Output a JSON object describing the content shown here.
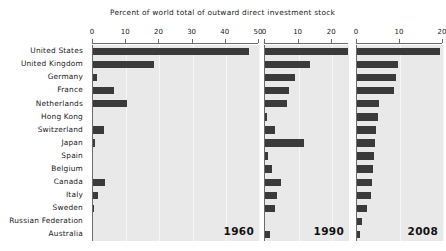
{
  "chart_data": {
    "type": "bar",
    "title": "Percent of world total of outward direct investment stock",
    "xlabel": "",
    "ylabel": "",
    "orientation": "horizontal",
    "grid": true,
    "legend_position": "none",
    "categories": [
      "United States",
      "United Kingdom",
      "Germany",
      "France",
      "Netherlands",
      "Hong Kong",
      "Switzerland",
      "Japan",
      "Spain",
      "Belgium",
      "Canada",
      "Italy",
      "Sweden",
      "Russian Federation",
      "Australia"
    ],
    "panels": [
      {
        "name": "1960",
        "xlim": [
          0,
          50
        ],
        "ticks": [
          0,
          10,
          20,
          30,
          40,
          50
        ],
        "tick_labels": [
          "0",
          "10",
          "20",
          "30",
          "40",
          "50"
        ],
        "values": [
          47.1,
          18.3,
          1.2,
          6.2,
          10.3,
          0.0,
          3.4,
          0.7,
          0.0,
          0.0,
          3.7,
          1.6,
          0.4,
          0.0,
          0.0
        ]
      },
      {
        "name": "1990",
        "xlim": [
          0,
          25
        ],
        "ticks": [
          0,
          10,
          20
        ],
        "tick_labels": [
          "0",
          "10",
          "20"
        ],
        "values": [
          24.6,
          13.3,
          8.8,
          7.0,
          6.4,
          0.7,
          3.1,
          11.6,
          0.9,
          2.0,
          4.9,
          3.5,
          2.9,
          0.0,
          1.5
        ]
      },
      {
        "name": "2008",
        "xlim": [
          0,
          20
        ],
        "ticks": [
          0,
          10,
          20
        ],
        "tick_labels": [
          "0",
          "10",
          "20"
        ],
        "values": [
          19.3,
          9.6,
          9.1,
          8.7,
          5.0,
          4.8,
          4.5,
          4.3,
          3.9,
          3.8,
          3.5,
          3.3,
          2.3,
          1.2,
          0.7
        ]
      }
    ],
    "colors": {
      "bar": "#3a3a3a",
      "panel_background": "#e9e9e9",
      "axis": "#6b6b6b",
      "gridline": "#f6f6f6",
      "text": "#1a1a1a"
    }
  }
}
